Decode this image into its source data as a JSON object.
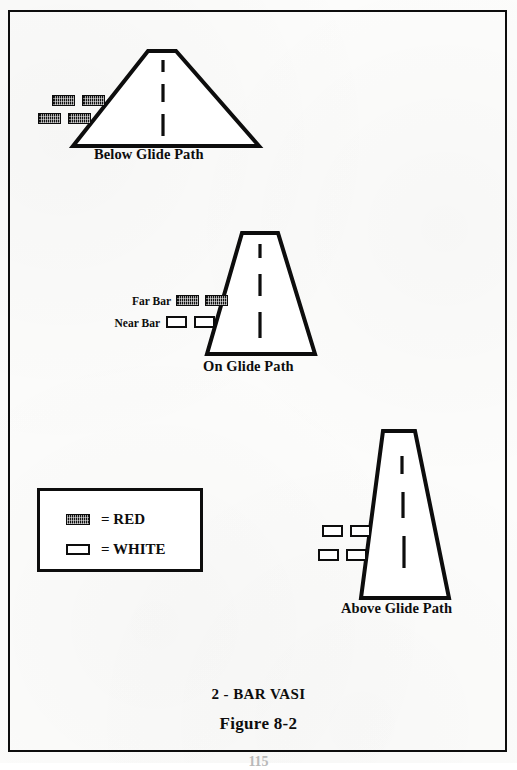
{
  "document": {
    "figure_title": "2 - BAR VASI",
    "figure_number": "Figure  8-2",
    "page_number": "115"
  },
  "legend": {
    "rows": [
      {
        "swatch": "red-light-bar",
        "label": "= RED"
      },
      {
        "swatch": "white-light-bar",
        "label": "= WHITE"
      }
    ]
  },
  "diagrams": [
    {
      "id": "below-glide-path",
      "caption": "Below Glide Path",
      "shape": "wide-flat-trapezoid",
      "meaning": "aircraft below glide path",
      "bar_annotations": [],
      "lights": [
        {
          "row": "far-bar",
          "position": "left",
          "color": "red"
        },
        {
          "row": "far-bar",
          "position": "right",
          "color": "red"
        },
        {
          "row": "near-bar",
          "position": "left",
          "color": "red"
        },
        {
          "row": "near-bar",
          "position": "right",
          "color": "red"
        }
      ]
    },
    {
      "id": "on-glide-path",
      "caption": "On Glide Path",
      "shape": "medium-trapezoid",
      "meaning": "aircraft on glide path",
      "bar_annotations": [
        {
          "label": "Far Bar"
        },
        {
          "label": "Near Bar"
        }
      ],
      "lights": [
        {
          "row": "far-bar",
          "position": "left",
          "color": "red"
        },
        {
          "row": "far-bar",
          "position": "right",
          "color": "red"
        },
        {
          "row": "near-bar",
          "position": "left",
          "color": "white"
        },
        {
          "row": "near-bar",
          "position": "right",
          "color": "white"
        }
      ]
    },
    {
      "id": "above-glide-path",
      "caption": "Above Glide Path",
      "shape": "narrow-tall-trapezoid",
      "meaning": "aircraft above glide path",
      "bar_annotations": [],
      "lights": [
        {
          "row": "far-bar",
          "position": "left",
          "color": "white"
        },
        {
          "row": "far-bar",
          "position": "right",
          "color": "white"
        },
        {
          "row": "near-bar",
          "position": "left",
          "color": "white"
        },
        {
          "row": "near-bar",
          "position": "right",
          "color": "white"
        }
      ]
    }
  ],
  "colors": {
    "ink": "#0d0d0d",
    "paper": "#fcfcfb",
    "red_light": "#111111",
    "white_light": "#ffffff"
  }
}
